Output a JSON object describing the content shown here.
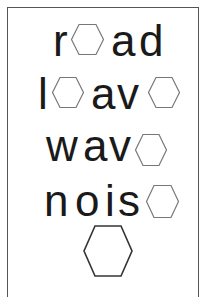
{
  "worksheet": {
    "title": "Missing letter hexagon puzzle",
    "rows": [
      {
        "word_pattern": "r_ad",
        "letters": [
          "r",
          "",
          "a",
          "d"
        ]
      },
      {
        "word_pattern": "l_av_",
        "letters": [
          "l",
          "",
          "a",
          "v",
          ""
        ]
      },
      {
        "word_pattern": "wav_",
        "letters": [
          "w",
          "a",
          "v",
          ""
        ]
      },
      {
        "word_pattern": "nois_",
        "letters": [
          "n",
          "o",
          "i",
          "s",
          ""
        ]
      }
    ],
    "answer_box": {
      "shape": "hexagon",
      "content": ""
    },
    "colors": {
      "text": "#1a1a1a",
      "hexagon_stroke": "#777777",
      "border": "#555555",
      "background": "#ffffff"
    }
  }
}
